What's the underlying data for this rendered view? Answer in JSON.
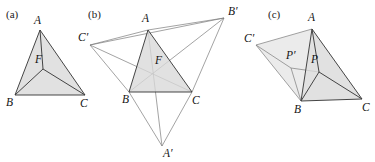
{
  "figure": {
    "background_color": "#ffffff",
    "line_color": "#3b3b3b",
    "thin_line_color": "#7b7b7b",
    "shade_color": "#d9d9d9",
    "label_color": "#141414"
  },
  "panels": [
    {
      "tag": "(a)",
      "tag_pos": [
        6,
        18
      ],
      "description": "triangle-with-fermat-point",
      "points": {
        "A": {
          "label": "A",
          "x": 40,
          "y": 30,
          "lx": 34,
          "ly": 24
        },
        "B": {
          "label": "B",
          "x": 15,
          "y": 95,
          "lx": 6,
          "ly": 106
        },
        "C": {
          "label": "C",
          "x": 85,
          "y": 95,
          "lx": 80,
          "ly": 107
        },
        "F": {
          "label": "F",
          "x": 43,
          "y": 69,
          "lx": 35,
          "ly": 63
        }
      },
      "triangle": [
        "A",
        "B",
        "C"
      ],
      "cevians": [
        [
          "F",
          "A"
        ],
        [
          "F",
          "B"
        ],
        [
          "F",
          "C"
        ]
      ]
    },
    {
      "tag": "(b)",
      "tag_pos": [
        88,
        18
      ],
      "description": "fermat-point-with-equilateral-constructions",
      "points": {
        "A": {
          "label": "A",
          "x": 148,
          "y": 30,
          "lx": 142,
          "ly": 22
        },
        "B": {
          "label": "B",
          "x": 129,
          "y": 92,
          "lx": 122,
          "ly": 103
        },
        "C": {
          "label": "C",
          "x": 192,
          "y": 92,
          "lx": 192,
          "ly": 104
        },
        "F": {
          "label": "F",
          "x": 153,
          "y": 76,
          "lx": 155,
          "ly": 64
        },
        "Ap": {
          "label": "A′",
          "x": 162,
          "y": 146,
          "lx": 163,
          "ly": 157
        },
        "Bp": {
          "label": "B′",
          "x": 224,
          "y": 18,
          "lx": 228,
          "ly": 15
        },
        "Cp": {
          "label": "C′",
          "x": 90,
          "y": 45,
          "lx": 78,
          "ly": 41
        }
      },
      "triangle": [
        "A",
        "B",
        "C"
      ],
      "cevians": [
        [
          "Ap",
          "A"
        ],
        [
          "Bp",
          "B"
        ],
        [
          "Cp",
          "C"
        ]
      ],
      "outer_triangles": [
        [
          "B",
          "C",
          "Ap"
        ],
        [
          "A",
          "C",
          "Bp"
        ],
        [
          "A",
          "B",
          "Cp"
        ]
      ],
      "extra_segments": [
        [
          "Cp",
          "Bp"
        ],
        [
          "Cp",
          "B"
        ],
        [
          "Bp",
          "C"
        ],
        [
          "Cp",
          "A"
        ],
        [
          "Bp",
          "A"
        ]
      ]
    },
    {
      "tag": "(c)",
      "tag_pos": [
        268,
        18
      ],
      "description": "generic-point-rotation",
      "points": {
        "A": {
          "label": "A",
          "x": 312,
          "y": 29,
          "lx": 308,
          "ly": 21
        },
        "B": {
          "label": "B",
          "x": 301,
          "y": 101,
          "lx": 294,
          "ly": 113
        },
        "C": {
          "label": "C",
          "x": 362,
          "y": 99,
          "lx": 362,
          "ly": 111
        },
        "P": {
          "label": "P",
          "x": 319,
          "y": 72,
          "lx": 311,
          "ly": 63
        },
        "Pp": {
          "label": "P′",
          "x": 291,
          "y": 68,
          "lx": 286,
          "ly": 59
        },
        "Cp": {
          "label": "C′",
          "x": 256,
          "y": 45,
          "lx": 244,
          "ly": 42
        }
      },
      "triangle": [
        "A",
        "B",
        "C"
      ],
      "cevians": [
        [
          "P",
          "A"
        ],
        [
          "P",
          "B"
        ],
        [
          "P",
          "C"
        ]
      ],
      "outer_triangles": [
        [
          "A",
          "B",
          "Cp"
        ]
      ],
      "extra_segments": [
        [
          "Cp",
          "Pp"
        ],
        [
          "Pp",
          "B"
        ],
        [
          "Pp",
          "P"
        ],
        [
          "Cp",
          "B"
        ],
        [
          "Cp",
          "A"
        ]
      ]
    }
  ]
}
